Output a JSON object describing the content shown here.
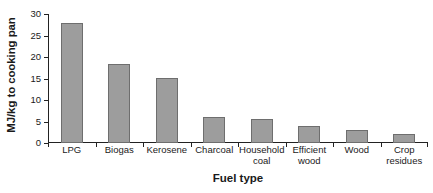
{
  "chart_data": {
    "type": "bar",
    "title": "",
    "xlabel": "Fuel type",
    "ylabel": "MJ/kg to cooking pan",
    "categories": [
      "LPG",
      "Biogas",
      "Kerosene",
      "Charcoal",
      "Household coal",
      "Efficient wood",
      "Wood",
      "Crop residues"
    ],
    "values": [
      28.0,
      18.3,
      15.1,
      6.0,
      5.6,
      4.0,
      3.0,
      2.0
    ],
    "ylim": [
      0,
      30
    ],
    "yticks": [
      0,
      5,
      10,
      15,
      20,
      25,
      30
    ],
    "ytick_labels": [
      "0",
      "5",
      "10",
      "15",
      "20",
      "25",
      "30"
    ],
    "grid": false,
    "legend": "none",
    "bar_color": "#9d9d9d",
    "bar_border_color": "#6e6e6e",
    "axis_color": "#222222",
    "background_color": "#ffffff"
  }
}
